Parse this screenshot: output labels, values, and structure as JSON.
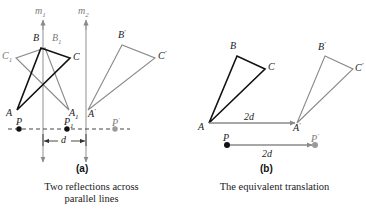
{
  "figure": {
    "width": 366,
    "height": 213,
    "colors": {
      "black": "#111111",
      "gray": "#8a8a8a",
      "dashed": "#555555",
      "background": "#ffffff"
    }
  },
  "panel_a": {
    "caption_letter": "(a)",
    "caption_line1": "Two reflections across",
    "caption_line2": "parallel lines",
    "mirror_lines": [
      {
        "label": "m",
        "sub": "1",
        "x": 43
      },
      {
        "label": "m",
        "sub": "2",
        "x": 86
      }
    ],
    "distance_label": "d",
    "triangles": [
      {
        "name": "original",
        "color": "black",
        "vertices": [
          {
            "label": "A",
            "sub": "",
            "x": 17,
            "y": 110
          },
          {
            "label": "B",
            "sub": "",
            "x": 41,
            "y": 48
          },
          {
            "label": "C",
            "sub": "",
            "x": 70,
            "y": 58
          }
        ]
      },
      {
        "name": "first-reflection",
        "color": "gray",
        "vertices": [
          {
            "label": "A",
            "sub": "1",
            "x": 69,
            "y": 110
          },
          {
            "label": "B",
            "sub": "1",
            "x": 45,
            "y": 48
          },
          {
            "label": "C",
            "sub": "1",
            "x": 16,
            "y": 58
          }
        ]
      },
      {
        "name": "second-reflection",
        "color": "gray",
        "vertices": [
          {
            "label": "A",
            "sub": "'",
            "x": 88,
            "y": 110
          },
          {
            "label": "B",
            "sub": "'",
            "x": 122,
            "y": 45
          },
          {
            "label": "C",
            "sub": "'",
            "x": 155,
            "y": 58
          }
        ]
      }
    ],
    "points": [
      {
        "label": "P",
        "sub": "",
        "x": 19,
        "y": 129,
        "color": "black"
      },
      {
        "label": "P",
        "sub": "1",
        "x": 67,
        "y": 129,
        "color": "black"
      },
      {
        "label": "P",
        "sub": "'",
        "x": 115,
        "y": 129,
        "color": "gray"
      }
    ]
  },
  "panel_b": {
    "caption_letter": "(b)",
    "caption_line1": "The equivalent translation",
    "arrow_label_top": "2d",
    "arrow_label_bottom": "2d",
    "triangles": [
      {
        "name": "original",
        "color": "black",
        "vertices": [
          {
            "label": "A",
            "sub": "",
            "x": 209,
            "y": 123
          },
          {
            "label": "B",
            "sub": "",
            "x": 237,
            "y": 56
          },
          {
            "label": "C",
            "sub": "",
            "x": 265,
            "y": 69
          }
        ]
      },
      {
        "name": "translated",
        "color": "gray",
        "vertices": [
          {
            "label": "A",
            "sub": "'",
            "x": 297,
            "y": 123
          },
          {
            "label": "B",
            "sub": "'",
            "x": 325,
            "y": 56
          },
          {
            "label": "C",
            "sub": "'",
            "x": 353,
            "y": 69
          }
        ]
      }
    ],
    "points": [
      {
        "label": "P",
        "sub": "",
        "x": 227,
        "y": 145,
        "color": "black"
      },
      {
        "label": "P",
        "sub": "'",
        "x": 315,
        "y": 145,
        "color": "gray"
      }
    ]
  }
}
